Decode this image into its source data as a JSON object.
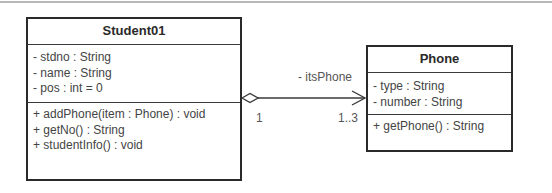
{
  "diagram": {
    "type": "UML class diagram",
    "classes": [
      {
        "name": "Student01",
        "attributes": [
          "- stdno : String",
          "- name : String",
          "- pos : int = 0"
        ],
        "operations": [
          "+ addPhone(item : Phone) : void",
          "+ getNo() : String",
          "+ studentInfo() : void"
        ]
      },
      {
        "name": "Phone",
        "attributes": [
          "- type : String",
          "- number : String"
        ],
        "operations": [
          "+ getPhone() : String"
        ]
      }
    ],
    "association": {
      "kind": "aggregation",
      "source": "Student01",
      "target": "Phone",
      "navigable_to": "Phone",
      "role_name": "- itsPhone",
      "source_multiplicity": "1",
      "target_multiplicity": "1..3"
    }
  },
  "colors": {
    "border": "#2a2a2a",
    "text": "#444444",
    "background": "#ffffff",
    "top_rule": "#b8b8b8"
  }
}
